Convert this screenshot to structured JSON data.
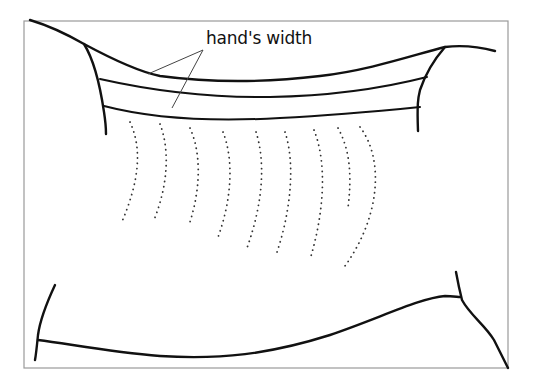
{
  "figure": {
    "label": "hand's width",
    "colors": {
      "line": "#111111",
      "frame": "#9a9a9a",
      "leader": "#444444",
      "background": "#ffffff"
    },
    "dotted_lines_count": 9,
    "band_lines_count": 3
  }
}
